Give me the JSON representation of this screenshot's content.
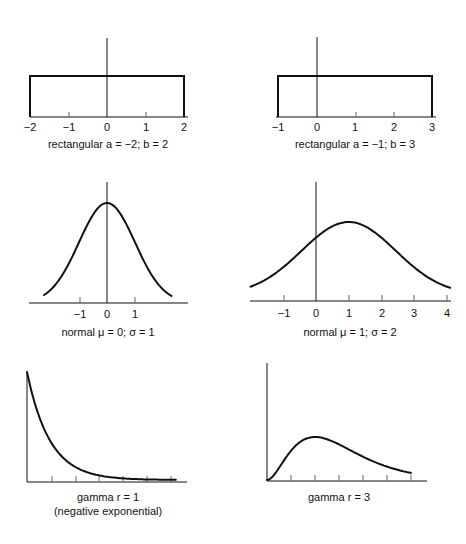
{
  "chart_data": [
    {
      "id": "rect1",
      "type": "line",
      "title": "rectangular a = −2; b = 2",
      "distribution": "rectangular",
      "params": {
        "a": -2,
        "b": 2
      },
      "x_ticks": [
        "−2",
        "−1",
        "0",
        "1",
        "2"
      ],
      "xlim": [
        -2,
        2
      ],
      "points": [
        [
          -2,
          0
        ],
        [
          -2,
          0.25
        ],
        [
          2,
          0.25
        ],
        [
          2,
          0
        ]
      ]
    },
    {
      "id": "rect2",
      "type": "line",
      "title": "rectangular a = −1; b = 3",
      "distribution": "rectangular",
      "params": {
        "a": -1,
        "b": 3
      },
      "x_ticks": [
        "−1",
        "0",
        "1",
        "2",
        "3"
      ],
      "xlim": [
        -1,
        3
      ],
      "points": [
        [
          -1,
          0
        ],
        [
          -1,
          0.25
        ],
        [
          3,
          0.25
        ],
        [
          3,
          0
        ]
      ]
    },
    {
      "id": "norm1",
      "type": "line",
      "title": "normal μ = 0; σ = 1",
      "distribution": "normal",
      "params": {
        "mu": 0,
        "sigma": 1
      },
      "x_ticks": [
        "−1",
        "0",
        "1"
      ],
      "xlim": [
        -2.3,
        2.3
      ]
    },
    {
      "id": "norm2",
      "type": "line",
      "title": "normal μ = 1; σ = 2",
      "distribution": "normal",
      "params": {
        "mu": 1,
        "sigma": 2
      },
      "x_ticks": [
        "−1",
        "0",
        "1",
        "2",
        "3",
        "4"
      ],
      "xlim": [
        -2,
        4
      ]
    },
    {
      "id": "gamma1",
      "type": "line",
      "title": "gamma r = 1",
      "subtitle": "(negative exponential)",
      "distribution": "gamma",
      "params": {
        "r": 1
      },
      "x_ticks_count": 6,
      "xlim": [
        0,
        6.2
      ]
    },
    {
      "id": "gamma3",
      "type": "line",
      "title": "gamma r = 3",
      "distribution": "gamma",
      "params": {
        "r": 3
      },
      "x_ticks_count": 6,
      "xlim": [
        0,
        6
      ]
    }
  ],
  "captions": {
    "rect1": "rectangular a = −2; b = 2",
    "rect2": "rectangular a = −1; b = 3",
    "norm1": "normal μ = 0; σ = 1",
    "norm2": "normal μ = 1; σ = 2",
    "gamma1": "gamma r = 1",
    "gamma1_sub": "(negative exponential)",
    "gamma3": "gamma r = 3"
  },
  "ticks": {
    "rect1": [
      "−2",
      "−1",
      "0",
      "1",
      "2"
    ],
    "rect2": [
      "−1",
      "0",
      "1",
      "2",
      "3"
    ],
    "norm1": [
      "−1",
      "0",
      "1"
    ],
    "norm2": [
      "−1",
      "0",
      "1",
      "2",
      "3",
      "4"
    ]
  }
}
